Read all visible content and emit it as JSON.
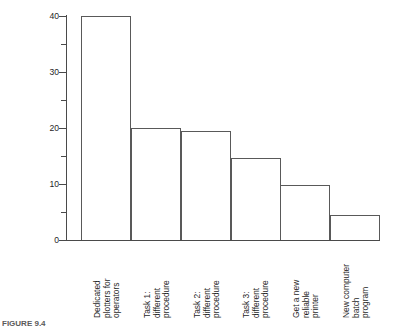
{
  "chart_data": {
    "type": "bar",
    "title": "",
    "subtitle": "",
    "xlabel": "",
    "ylabel": "Expected percentage improvement",
    "ylim": [
      0,
      40
    ],
    "xlim": [
      0,
      6
    ],
    "grid": false,
    "legend": false,
    "legend_position": "none",
    "bar_style": "outlined, unfilled, adjacent (no gaps)",
    "orientation": "vertical",
    "y_major_ticks": [
      0,
      10,
      20,
      30,
      40
    ],
    "y_minor_ticks": [
      5,
      15,
      25,
      35
    ],
    "y_tick_labels": [
      "0",
      "10",
      "20",
      "30",
      "40"
    ],
    "categories": [
      "Dedicated plotters for operators",
      "Task 1: different procedure",
      "Task 2: different procedure",
      "Task 3: different procedure",
      "Get a new reliable printer",
      "New computer batch program"
    ],
    "category_lines": [
      "Dedicated\nplotters for\noperators",
      "Task 1:\ndifferent\nprocedure",
      "Task 2:\ndifferent\nprocedure",
      "Task 3:\ndifferent\nprocedure",
      "Get a new\nreliable\nprinter",
      "New computer\nbatch\nprogram"
    ],
    "values": [
      40,
      20,
      19.5,
      14.7,
      9.8,
      4.5
    ],
    "series": [
      {
        "name": "Expected percentage improvement",
        "values": [
          40,
          20,
          19.5,
          14.7,
          9.8,
          4.5
        ]
      }
    ],
    "colors": {
      "bar_outline": "#595959",
      "bar_fill": "#ffffff",
      "axis": "#4a4a4a",
      "text": "#1f1f1f",
      "background": "#ffffff"
    }
  },
  "caption": {
    "label": "FIGURE 9.4",
    "text": ""
  }
}
